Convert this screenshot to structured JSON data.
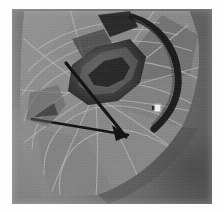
{
  "image": {
    "title": "Hang glider sail viewed from below",
    "medium": "black and white photographic print",
    "border_color": "#fdfdfd",
    "palette": {
      "paper_white": "#fdfdfd",
      "sky_light": "#8e8e8e",
      "sky_mid": "#7b7b7b",
      "sky_dark": "#5a5a5a",
      "sail_light": "#8d8d8d",
      "sail_mid": "#7a7a7a",
      "sail_dark": "#636363",
      "batten_line": "#b9b9b9",
      "structure_black": "#141414",
      "highlight_white": "#f2f2f2"
    },
    "canvas": {
      "x": 12,
      "y": 9,
      "width": 200,
      "height": 195
    }
  },
  "subject": {
    "name": "hang-glider-sail",
    "description": "Fan of trapezoidal sail panels radiating from a dark central keel structure, seen in silhouette against an overcast sky.",
    "features": [
      {
        "name": "sail-panel-fan",
        "label": "Radiating sail panels"
      },
      {
        "name": "batten-seam-grid",
        "label": "Batten seams / panel stitching"
      },
      {
        "name": "keel-structure",
        "label": "Dark central keel and crossbar"
      },
      {
        "name": "leading-edge-spar",
        "label": "Leading edge spar"
      },
      {
        "name": "control-bar-strut",
        "label": "Control bar strut"
      },
      {
        "name": "highlight-speck",
        "label": "Specular highlight on sail"
      }
    ],
    "speck": {
      "x": 143,
      "y": 96,
      "width": 5,
      "height": 6
    }
  },
  "chart_data": null
}
